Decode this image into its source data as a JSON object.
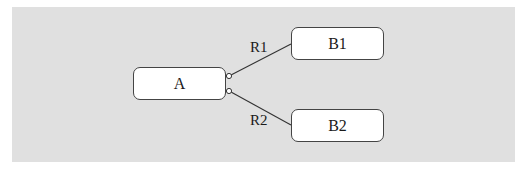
{
  "diagram": {
    "background_color": "#e0e0e0",
    "nodes": [
      {
        "id": "A",
        "label": "A"
      },
      {
        "id": "B1",
        "label": "B1"
      },
      {
        "id": "B2",
        "label": "B2"
      }
    ],
    "edges": [
      {
        "from": "A",
        "to": "B1",
        "label": "R1"
      },
      {
        "from": "A",
        "to": "B2",
        "label": "R2"
      }
    ]
  }
}
